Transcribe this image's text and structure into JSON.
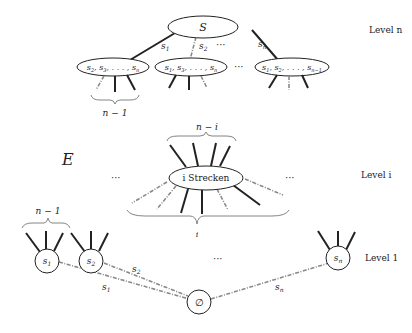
{
  "diagram": {
    "levels": {
      "top": "Level n",
      "mid": "Level i",
      "bottom": "Level 1"
    },
    "set_label": "E",
    "ellipsis": "···",
    "top": {
      "root": "S",
      "edges": [
        "s1",
        "s2",
        "sn"
      ],
      "children": [
        "s2, s3, ..., sn",
        "s1, s3, ..., sn",
        "s1, s2, ..., sn-1"
      ],
      "brace_label": "n − 1"
    },
    "middle": {
      "node": "i Strecken",
      "top_brace": "n − i",
      "bottom_brace": "i"
    },
    "bottom": {
      "nodes": [
        "s1",
        "s2",
        "sn"
      ],
      "empty": "∅",
      "edges": [
        "s1",
        "s2",
        "sn"
      ],
      "brace_label": "n − 1"
    }
  }
}
